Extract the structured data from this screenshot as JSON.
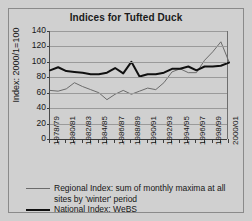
{
  "chart_data": {
    "type": "line",
    "title": "Indices for Tufted Duck",
    "xlabel": "",
    "ylabel": "Index: 2000/1=100",
    "ylim": [
      0,
      140
    ],
    "yticks": [
      0,
      20,
      40,
      60,
      80,
      100,
      120,
      140
    ],
    "grid": true,
    "legend_position": "bottom",
    "categories": [
      "1978/79",
      "1979/80",
      "1980/81",
      "1981/82",
      "1982/83",
      "1983/84",
      "1984/85",
      "1985/86",
      "1986/87",
      "1987/88",
      "1988/89",
      "1989/90",
      "1990/91",
      "1991/92",
      "1992/93",
      "1993/94",
      "1994/95",
      "1995/96",
      "1996/97",
      "1997/98",
      "1998/99",
      "1999/00",
      "2000/01"
    ],
    "xtick_labels": [
      "1978/79",
      "1980/81",
      "1982/83",
      "1984/85",
      "1986/87",
      "1988/89",
      "1990/91",
      "1992/93",
      "1994/95",
      "1996/97",
      "1998/99",
      "2000/01"
    ],
    "series": [
      {
        "name": "Regional Index: sum of monthly maxima at all sites by 'winter' period",
        "color": "#6b6b6b",
        "width": 1,
        "values": [
          63,
          62,
          65,
          73,
          68,
          64,
          60,
          51,
          58,
          63,
          58,
          62,
          66,
          64,
          73,
          87,
          91,
          86,
          86,
          102,
          113,
          126,
          100
        ]
      },
      {
        "name": "National Index: WeBS",
        "color": "#101010",
        "width": 2,
        "values": [
          89,
          93,
          88,
          87,
          86,
          84,
          84,
          86,
          92,
          85,
          100,
          81,
          84,
          84,
          86,
          91,
          91,
          94,
          89,
          94,
          94,
          95,
          99
        ]
      }
    ]
  },
  "legend": {
    "regional_line1": "Regional Index: sum of monthly maxima at all",
    "regional_line2": "sites by 'winter' period",
    "national": "National Index: WeBS"
  }
}
